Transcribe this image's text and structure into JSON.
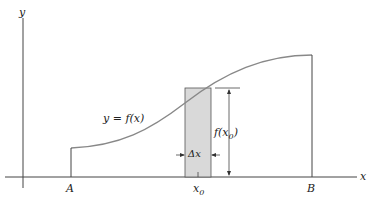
{
  "diagram": {
    "axes": {
      "x_label": "x",
      "y_label": "y"
    },
    "curve_label": "y = f(x)",
    "points": {
      "a": "A",
      "b": "B",
      "x0": "x",
      "x0_sub": "0"
    },
    "strip": {
      "width_label": "Δx",
      "height_label": "f(x",
      "height_label_sub": "0",
      "height_label_close": ")"
    },
    "colors": {
      "strip_fill": "#d9d9d9",
      "curve": "#888888",
      "lines": "#333333"
    }
  }
}
